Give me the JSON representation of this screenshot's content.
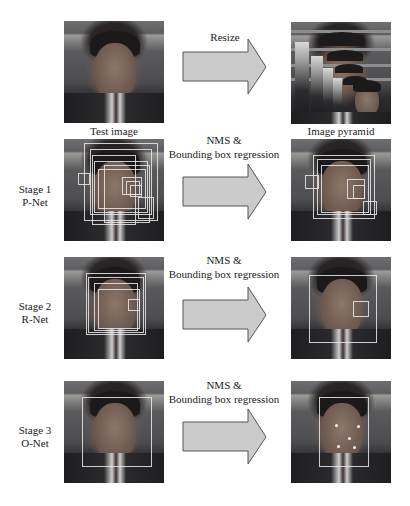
{
  "header": {
    "input_caption": "Test image",
    "pyramid_caption": "Image pyramid",
    "resize_label": "Resize"
  },
  "stages": [
    {
      "index": 1,
      "title": "Stage 1",
      "network": "P-Net",
      "operation_line1": "NMS &",
      "operation_line2": "Bounding box regression"
    },
    {
      "index": 2,
      "title": "Stage 2",
      "network": "R-Net",
      "operation_line1": "NMS &",
      "operation_line2": "Bounding box regression"
    },
    {
      "index": 3,
      "title": "Stage 3",
      "network": "O-Net",
      "operation_line1": "NMS &",
      "operation_line2": "Bounding box regression"
    }
  ],
  "colors": {
    "arrow_fill": "#cbcbcb",
    "arrow_stroke": "#555555",
    "bbox": "#ebebeb"
  },
  "icons": {
    "arrow": "right-block-arrow",
    "landmark": "white-dot"
  }
}
